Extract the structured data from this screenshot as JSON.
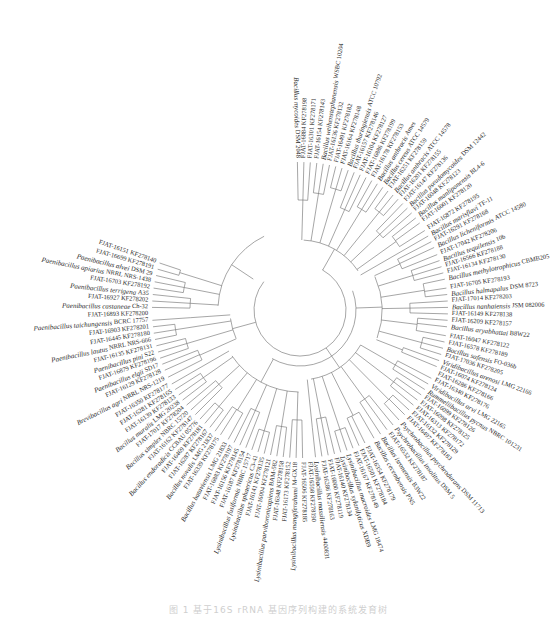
{
  "figure": {
    "type": "radial-phylogenetic-tree",
    "center": [
      300,
      310
    ],
    "leaf_radius": 152,
    "caption": "图 1  基于16S rRNA 基因序列构建的系统发育树",
    "line_color": "#6a6a6a",
    "text_color": "#2a2a2a"
  },
  "clades": [
    {
      "name": "Bacillus-cereus-group",
      "start_angle": -91,
      "end_angle": -30
    },
    {
      "name": "Bacillus-subtilis-group",
      "start_angle": -28,
      "end_angle": 24
    },
    {
      "name": "Viridibacillus-Rummeliibacillus-Psychrobacillus",
      "start_angle": 26,
      "end_angle": 85
    },
    {
      "name": "Lysinibacillus",
      "start_angle": 87,
      "end_angle": 150
    },
    {
      "name": "Bacillus-simplex-group",
      "start_angle": 152,
      "end_angle": 177
    },
    {
      "name": "Brevibacillus-Paenibacillus",
      "start_angle": 179,
      "end_angle": 248
    }
  ],
  "leaves": [
    {
      "species": "Bacillus mycoides",
      "strain": "DSM 2048",
      "angle": -91
    },
    {
      "species": "",
      "strain": "FJAT-16884 KF278198",
      "angle": -88.5
    },
    {
      "species": "",
      "strain": "FJAT-16301 KF278171",
      "angle": -86
    },
    {
      "species": "",
      "strain": "FJAT-16154 KF278143",
      "angle": -83.5
    },
    {
      "species": "Bacillus weihenstephanensis",
      "strain": "WSBC 10204",
      "angle": -81
    },
    {
      "species": "",
      "strain": "FJAT-16136 KF278132",
      "angle": -78.5
    },
    {
      "species": "",
      "strain": "FJAT-16491 KF278182",
      "angle": -76
    },
    {
      "species": "",
      "strain": "FJAT-16164 KF278148",
      "angle": -73.5
    },
    {
      "species": "Bacillus thuringiensis",
      "strain": "ATCC 10792",
      "angle": -71
    },
    {
      "species": "",
      "strain": "FJAT-16157 KF278146",
      "angle": -68.5
    },
    {
      "species": "",
      "strain": "FJAT-16104 KF278127",
      "angle": -66
    },
    {
      "species": "",
      "strain": "FJAT-16886 KF278199",
      "angle": -63.5
    },
    {
      "species": "",
      "strain": "FJAT-16178 KF278153",
      "angle": -61
    },
    {
      "species": "Bacillus anthracis",
      "strain": "Ames",
      "angle": -58.5
    },
    {
      "species": "Bacillus cereus",
      "strain": "ATCC 14579",
      "angle": -56
    },
    {
      "species": "",
      "strain": "FJAT-16251 KF278159",
      "angle": -53.5
    },
    {
      "species": "Bacillus anthracis",
      "strain": "ATCC 14578",
      "angle": -51
    },
    {
      "species": "",
      "strain": "FJAT-16201 KF278155",
      "angle": -48.5
    },
    {
      "species": "",
      "strain": "FJAT-16147 KF278136",
      "angle": -46
    },
    {
      "species": "Bacillus pseudomycoides",
      "strain": "DSM 12442",
      "angle": -43.5
    },
    {
      "species": "",
      "strain": "FJAT-16048 KF278123",
      "angle": -41
    },
    {
      "species": "Bacillus manliponensis",
      "strain": "BL4-6",
      "angle": -38.5
    },
    {
      "species": "",
      "strain": "FJAT-16001 KF278120",
      "angle": -36
    },
    {
      "species": "",
      "strain": "FJAT-16872 KF278195",
      "angle": -32.5
    },
    {
      "species": "Bacillus marisflavi",
      "strain": "TF-11",
      "angle": -30
    },
    {
      "species": "",
      "strain": "FJAT-16291 KF278168",
      "angle": -27.5
    },
    {
      "species": "Bacillus licheniformis",
      "strain": "ATCC 14580",
      "angle": -25
    },
    {
      "species": "",
      "strain": "FJAT-17042 KF278206",
      "angle": -22
    },
    {
      "species": "Bacillus tequilensis",
      "strain": "10b",
      "angle": -19.5
    },
    {
      "species": "",
      "strain": "FJAT-16566 KF278188",
      "angle": -17
    },
    {
      "species": "",
      "strain": "FJAT-16134 KF278130",
      "angle": -14.5
    },
    {
      "species": "Bacillus methylotrophicus",
      "strain": "CBMB205",
      "angle": -12
    },
    {
      "species": "",
      "strain": "FJAT-16705 KF278193",
      "angle": -8.5
    },
    {
      "species": "Bacillus halmapalus",
      "strain": "DSM 8723",
      "angle": -6
    },
    {
      "species": "",
      "strain": "FJAT-17014 KF278203",
      "angle": -3.5
    },
    {
      "species": "Bacillus nanhaiensis",
      "strain": "JSM 082006",
      "angle": -1
    },
    {
      "species": "",
      "strain": "FJAT-16149 KF278138",
      "angle": 1.5
    },
    {
      "species": "",
      "strain": "FJAT-16209 KF278157",
      "angle": 4
    },
    {
      "species": "Bacillus aryabhattai",
      "strain": "B8W22",
      "angle": 6.5
    },
    {
      "species": "",
      "strain": "FJAT-16047 KF278122",
      "angle": 10
    },
    {
      "species": "",
      "strain": "FJAT-16578 KF278189",
      "angle": 12.5
    },
    {
      "species": "Bacillus safensis",
      "strain": "FO-036b",
      "angle": 15
    },
    {
      "species": "",
      "strain": "FJAT-17036 KF278205",
      "angle": 17.5
    },
    {
      "species": "Viridibacillus arenosi",
      "strain": "LMG 22166",
      "angle": 20
    },
    {
      "species": "",
      "strain": "FJAT-16074 KF278124",
      "angle": 22.5
    },
    {
      "species": "",
      "strain": "FJAT-16286 KF278166",
      "angle": 25
    },
    {
      "species": "",
      "strain": "FJAT-16340 KF278176",
      "angle": 27.5
    },
    {
      "species": "Viridibacillus arvi",
      "strain": "LMG 22165",
      "angle": 30
    },
    {
      "species": "Rummeliibacillus pycnus",
      "strain": "NBRC 101231",
      "angle": 32.5
    },
    {
      "species": "",
      "strain": "FJAT-16099 KF278126",
      "angle": 35
    },
    {
      "species": "",
      "strain": "FJAT-16098 KF278125",
      "angle": 37.5
    },
    {
      "species": "",
      "strain": "FJAT-16313 KF278172",
      "angle": 40
    },
    {
      "species": "",
      "strain": "FJAT-16132 KF278129",
      "angle": 42.5
    },
    {
      "species": "",
      "strain": "FJAT-16497 KF278183",
      "angle": 45
    },
    {
      "species": "Psychrobacillus psychrodurans",
      "strain": "DSM 11713",
      "angle": 48
    },
    {
      "species": "Psychrobacillus insolitus",
      "strain": "DSM 5",
      "angle": 51
    },
    {
      "species": "",
      "strain": "FJAT-16532 KF278187",
      "angle": 54
    },
    {
      "species": "Bacillus isronensis",
      "strain": "B3W22",
      "angle": 57
    },
    {
      "species": "Bacillus cecembensis",
      "strain": "PN5",
      "angle": 60
    },
    {
      "species": "",
      "strain": "FJAT-16354 KF278179",
      "angle": 64
    },
    {
      "species": "",
      "strain": "FJAT-16501 KF278184",
      "angle": 66.5
    },
    {
      "species": "",
      "strain": "FJAT-16167 KF278149",
      "angle": 69
    },
    {
      "species": "Lysinibacillus macroides",
      "strain": "LMG 18474",
      "angle": 71.5
    },
    {
      "species": "Lysinibacillus xylanilyticus",
      "strain": "XDB9",
      "angle": 74
    },
    {
      "species": "",
      "strain": "FJAT-16140 KF278134",
      "angle": 76.5
    },
    {
      "species": "",
      "strain": "FJAT-16000 KF278119",
      "angle": 79
    },
    {
      "species": "",
      "strain": "FJAT-16286 KF278163",
      "angle": 81.5
    },
    {
      "species": "Lysinibacillus massiliensis",
      "strain": "4400831",
      "angle": 84
    },
    {
      "species": "",
      "strain": "FJAT-16598 KF278190",
      "angle": 86.5
    },
    {
      "species": "",
      "strain": "FJAT-16506 KF278185",
      "angle": 89
    },
    {
      "species": "Lysinibacillus mangiferahumi",
      "strain": "M-GX18",
      "angle": 91.5
    },
    {
      "species": "",
      "strain": "FJAT-16173 KF278152",
      "angle": 94
    },
    {
      "species": "",
      "strain": "FJAT-16348 KF278158",
      "angle": 96.5
    },
    {
      "species": "Lysinibacillus parviboronicapiens",
      "strain": "BAM-582",
      "angle": 99
    },
    {
      "species": "",
      "strain": "FJAT-16004 KF278121",
      "angle": 101.5
    },
    {
      "species": "",
      "strain": "FJAT-16141 KF278135",
      "angle": 104
    },
    {
      "species": "Lysinibacillus sphaericus",
      "strain": "C3-41",
      "angle": 106.5
    },
    {
      "species": "Lysinibacillus fusiformis",
      "strain": "NBRC 15717",
      "angle": 109
    },
    {
      "species": "",
      "strain": "FJAT-16187 KF278154",
      "angle": 111.5
    },
    {
      "species": "",
      "strain": "FJAT-16156 KF278145",
      "angle": 114
    },
    {
      "species": "",
      "strain": "FJAT-16883 KF278197",
      "angle": 116.5
    },
    {
      "species": "Bacillus bataviensis",
      "strain": "LMG 21833",
      "angle": 119
    },
    {
      "species": "",
      "strain": "FJAT-16339 KF278175",
      "angle": 122.5
    },
    {
      "species": "Bacillus novalis",
      "strain": "LMG 21837",
      "angle": 125
    },
    {
      "species": "",
      "strain": "FJAT-16287 KF278167",
      "angle": 127.5
    },
    {
      "species": "",
      "strain": "FJAT-16469 KF278181",
      "angle": 130
    },
    {
      "species": "Bacillus endoradicis",
      "strain": "CCBAU 05776",
      "angle": 132.5
    },
    {
      "species": "",
      "strain": "FJAT-16162 KF278147",
      "angle": 135
    },
    {
      "species": "Bacillus simplex",
      "strain": "NBRC 15720",
      "angle": 137.5
    },
    {
      "species": "",
      "strain": "FJAT-17017 KF278204",
      "angle": 140
    },
    {
      "species": "Bacillus muralis",
      "strain": "LMG 20238",
      "angle": 142.5
    },
    {
      "species": "",
      "strain": "FJAT-16139 KF278133",
      "angle": 145
    },
    {
      "species": "",
      "strain": "FJAT-16281 KF278165",
      "angle": 147.5
    },
    {
      "species": "",
      "strain": "FJAT-16350 KF278177",
      "angle": 150
    },
    {
      "species": "Brevibacillus agri",
      "strain": "NRRL NRS-1219",
      "angle": 153
    },
    {
      "species": "",
      "strain": "FJAT-16129 KF278128",
      "angle": 156
    },
    {
      "species": "Paenibacillus elgii",
      "strain": "SD17",
      "angle": 158.5
    },
    {
      "species": "",
      "strain": "FJAT-16879 KF278196",
      "angle": 161
    },
    {
      "species": "Paenibacillus pini",
      "strain": "S22",
      "angle": 163.5
    },
    {
      "species": "",
      "strain": "FJAT-16135 KF278131",
      "angle": 166
    },
    {
      "species": "Paenibacillus lautus",
      "strain": "NRRL NRS-666",
      "angle": 168.5
    },
    {
      "species": "",
      "strain": "FJAT-16445 KF278180",
      "angle": 171
    },
    {
      "species": "",
      "strain": "FJAT-16903 KF278201",
      "angle": 173.5
    },
    {
      "species": "Paenibacillus taichungensis",
      "strain": "BCRC 17757",
      "angle": 176
    },
    {
      "species": "",
      "strain": "FJAT-16893 KF278200",
      "angle": 178.5
    },
    {
      "species": "Paenibacillus castaneae",
      "strain": "Ch-32",
      "angle": 181
    },
    {
      "species": "",
      "strain": "FJAT-16927 KF278202",
      "angle": 183.5
    },
    {
      "species": "Paenibacillus terrigena",
      "strain": "A35",
      "angle": 186
    },
    {
      "species": "",
      "strain": "FJAT-16703 KF278192",
      "angle": 188.5
    },
    {
      "species": "Paenibacillus apiarius",
      "strain": "NRRL NRS-1438",
      "angle": 191
    },
    {
      "species": "Paenibacillus alvei",
      "strain": "DSM 29",
      "angle": 193.5
    },
    {
      "species": "",
      "strain": "FJAT-16699 KF278191",
      "angle": 196
    },
    {
      "species": "",
      "strain": "FJAT-16151 KF278140",
      "angle": 198.5
    }
  ]
}
